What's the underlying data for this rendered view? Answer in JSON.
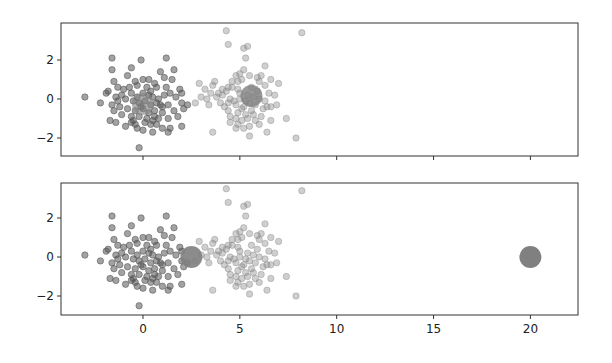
{
  "chart_data": [
    {
      "type": "scatter",
      "title": "",
      "xlabel": "",
      "ylabel": "",
      "xlim": [
        -4.2,
        22.5
      ],
      "ylim": [
        -2.9,
        3.8
      ],
      "xticks": [
        0,
        5,
        10,
        15,
        20
      ],
      "xtick_labels_visible": false,
      "yticks": [
        -2,
        0,
        2
      ],
      "ytick_labels": [
        "−2",
        "0",
        "2"
      ],
      "grid": false,
      "centroids": [
        {
          "x": 0.0,
          "y": -0.25,
          "color": "#808080",
          "opacity": 0.6
        },
        {
          "x": 5.6,
          "y": 0.15,
          "color": "#808080",
          "opacity": 0.8
        }
      ]
    },
    {
      "type": "scatter",
      "title": "",
      "xlabel": "",
      "ylabel": "",
      "xlim": [
        -4.2,
        22.5
      ],
      "ylim": [
        -2.9,
        3.8
      ],
      "xticks": [
        0,
        5,
        10,
        15,
        20
      ],
      "xtick_labels": [
        "0",
        "5",
        "10",
        "15",
        "20"
      ],
      "yticks": [
        -2,
        0,
        2
      ],
      "ytick_labels": [
        "−2",
        "0",
        "2"
      ],
      "grid": false,
      "centroids": [
        {
          "x": 2.5,
          "y": 0.0,
          "color": "#808080",
          "opacity": 0.9
        },
        {
          "x": 20.0,
          "y": 0.0,
          "color": "#808080",
          "opacity": 1.0
        }
      ]
    }
  ],
  "clusters": {
    "left": {
      "color": "#555555",
      "opacity": 0.55,
      "points": [
        [
          -3.0,
          0.1
        ],
        [
          -1.6,
          2.1
        ],
        [
          -0.1,
          2.0
        ],
        [
          1.2,
          2.1
        ],
        [
          -1.6,
          1.5
        ],
        [
          -0.6,
          1.6
        ],
        [
          0.9,
          1.4
        ],
        [
          1.6,
          1.5
        ],
        [
          -1.5,
          0.9
        ],
        [
          -0.8,
          1.2
        ],
        [
          -0.4,
          0.9
        ],
        [
          0.0,
          1.0
        ],
        [
          0.3,
          1.0
        ],
        [
          1.5,
          1.0
        ],
        [
          -0.3,
          0.7
        ],
        [
          0.6,
          0.8
        ],
        [
          0.7,
          0.6
        ],
        [
          1.2,
          0.6
        ],
        [
          1.9,
          0.5
        ],
        [
          2.0,
          0.3
        ],
        [
          -1.8,
          0.4
        ],
        [
          -1.9,
          0.3
        ],
        [
          -1.4,
          0.1
        ],
        [
          -1.1,
          0.2
        ],
        [
          -0.6,
          0.3
        ],
        [
          -0.3,
          0.1
        ],
        [
          0.0,
          0.3
        ],
        [
          0.3,
          0.2
        ],
        [
          0.5,
          0.1
        ],
        [
          0.8,
          0.0
        ],
        [
          1.1,
          0.2
        ],
        [
          1.7,
          0.1
        ],
        [
          -2.2,
          -0.2
        ],
        [
          -1.3,
          -0.1
        ],
        [
          -0.9,
          0.0
        ],
        [
          -0.5,
          -0.1
        ],
        [
          -0.2,
          -0.2
        ],
        [
          0.1,
          -0.1
        ],
        [
          0.4,
          -0.3
        ],
        [
          0.7,
          -0.2
        ],
        [
          1.0,
          -0.4
        ],
        [
          1.3,
          -0.3
        ],
        [
          2.0,
          -0.2
        ],
        [
          2.3,
          -0.3
        ],
        [
          -1.5,
          -0.6
        ],
        [
          -1.2,
          -0.4
        ],
        [
          -0.8,
          -0.5
        ],
        [
          -0.4,
          -0.6
        ],
        [
          0.0,
          -0.5
        ],
        [
          0.3,
          -0.7
        ],
        [
          0.6,
          -0.6
        ],
        [
          1.0,
          -0.7
        ],
        [
          1.6,
          -0.6
        ],
        [
          2.1,
          -0.5
        ],
        [
          -1.1,
          -0.8
        ],
        [
          -0.6,
          -0.9
        ],
        [
          -0.2,
          -0.9
        ],
        [
          0.2,
          -1.0
        ],
        [
          0.5,
          -1.1
        ],
        [
          0.8,
          -1.0
        ],
        [
          1.3,
          -1.0
        ],
        [
          -1.7,
          -1.1
        ],
        [
          -1.4,
          -1.2
        ],
        [
          -0.6,
          -1.2
        ],
        [
          -0.4,
          -1.3
        ],
        [
          0.1,
          -1.2
        ],
        [
          0.4,
          -1.3
        ],
        [
          0.7,
          -1.3
        ],
        [
          1.0,
          -1.5
        ],
        [
          1.4,
          -1.5
        ],
        [
          -0.9,
          -1.4
        ],
        [
          0.0,
          -1.6
        ],
        [
          0.5,
          -1.7
        ],
        [
          1.3,
          -1.7
        ],
        [
          2.0,
          -1.4
        ],
        [
          -0.2,
          -2.5
        ],
        [
          -0.5,
          -1.1
        ],
        [
          0.9,
          -0.3
        ],
        [
          -0.7,
          0.6
        ],
        [
          0.2,
          0.6
        ],
        [
          1.4,
          0.3
        ],
        [
          -1.0,
          0.5
        ],
        [
          0.6,
          -0.9
        ],
        [
          -1.3,
          0.6
        ],
        [
          1.8,
          -0.9
        ],
        [
          -0.1,
          -0.4
        ],
        [
          0.4,
          0.4
        ],
        [
          -1.6,
          -0.3
        ],
        [
          1.1,
          1.1
        ],
        [
          -0.3,
          -1.5
        ]
      ]
    },
    "right": {
      "color": "#888888",
      "opacity": 0.4,
      "points": [
        [
          4.3,
          3.5
        ],
        [
          4.4,
          2.8
        ],
        [
          5.2,
          2.6
        ],
        [
          5.4,
          2.7
        ],
        [
          8.2,
          3.4
        ],
        [
          5.3,
          2.1
        ],
        [
          5.2,
          1.5
        ],
        [
          6.3,
          1.7
        ],
        [
          4.8,
          1.2
        ],
        [
          4.9,
          0.9
        ],
        [
          5.1,
          1.0
        ],
        [
          5.5,
          1.2
        ],
        [
          5.9,
          1.1
        ],
        [
          6.1,
          1.2
        ],
        [
          6.6,
          1.0
        ],
        [
          7.0,
          0.8
        ],
        [
          2.9,
          0.8
        ],
        [
          3.7,
          0.9
        ],
        [
          3.6,
          0.7
        ],
        [
          4.4,
          0.6
        ],
        [
          4.6,
          0.6
        ],
        [
          4.9,
          0.5
        ],
        [
          5.6,
          0.6
        ],
        [
          6.3,
          0.7
        ],
        [
          6.0,
          0.9
        ],
        [
          3.5,
          0.3
        ],
        [
          3.9,
          0.3
        ],
        [
          4.1,
          0.2
        ],
        [
          4.3,
          0.4
        ],
        [
          5.0,
          0.3
        ],
        [
          5.4,
          0.2
        ],
        [
          6.5,
          0.3
        ],
        [
          3.0,
          0.1
        ],
        [
          3.3,
          0.0
        ],
        [
          3.8,
          0.1
        ],
        [
          4.5,
          0.0
        ],
        [
          4.7,
          -0.1
        ],
        [
          5.0,
          0.0
        ],
        [
          5.3,
          -0.1
        ],
        [
          5.7,
          0.1
        ],
        [
          6.0,
          0.0
        ],
        [
          6.3,
          -0.1
        ],
        [
          2.7,
          -0.2
        ],
        [
          3.4,
          -0.3
        ],
        [
          4.0,
          -0.2
        ],
        [
          4.4,
          -0.2
        ],
        [
          4.8,
          -0.3
        ],
        [
          5.2,
          -0.4
        ],
        [
          5.5,
          -0.2
        ],
        [
          5.8,
          -0.3
        ],
        [
          6.6,
          -0.4
        ],
        [
          6.9,
          -0.3
        ],
        [
          4.4,
          -0.6
        ],
        [
          4.9,
          -0.7
        ],
        [
          5.3,
          -0.8
        ],
        [
          5.6,
          -0.6
        ],
        [
          6.2,
          -0.5
        ],
        [
          6.4,
          -0.4
        ],
        [
          4.5,
          -0.9
        ],
        [
          4.8,
          -1.0
        ],
        [
          5.1,
          -1.1
        ],
        [
          5.4,
          -1.0
        ],
        [
          5.8,
          -1.1
        ],
        [
          6.6,
          -1.1
        ],
        [
          7.4,
          -1.0
        ],
        [
          4.5,
          -1.2
        ],
        [
          4.9,
          -1.3
        ],
        [
          5.5,
          -1.4
        ],
        [
          6.0,
          -1.3
        ],
        [
          5.2,
          -1.5
        ],
        [
          4.8,
          -1.5
        ],
        [
          3.6,
          -1.7
        ],
        [
          5.5,
          -1.9
        ],
        [
          6.4,
          -1.7
        ],
        [
          7.9,
          -2.0
        ],
        [
          4.1,
          0.5
        ],
        [
          5.9,
          0.4
        ],
        [
          4.6,
          0.9
        ],
        [
          5.1,
          -0.5
        ],
        [
          6.8,
          0.2
        ],
        [
          4.2,
          -0.4
        ],
        [
          5.7,
          -0.8
        ],
        [
          3.2,
          0.5
        ],
        [
          6.1,
          -0.9
        ],
        [
          5.0,
          1.3
        ]
      ]
    }
  },
  "colors": {
    "axes": "#333333",
    "background": "#ffffff"
  }
}
